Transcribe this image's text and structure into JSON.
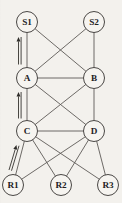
{
  "diagram": {
    "background_color": "#f3f1ed",
    "node_fill_color": "#f6f4f0",
    "node_stroke_color": "#4a4745",
    "edge_color": "#5d5a57",
    "arrow_color": "#2e2c29",
    "node_radius": 10.5,
    "nodes": [
      {
        "id": "S1",
        "label": "S1",
        "x": 27,
        "y": 22,
        "layer": "top"
      },
      {
        "id": "S2",
        "label": "S2",
        "x": 94,
        "y": 22,
        "layer": "top"
      },
      {
        "id": "A",
        "label": "A",
        "x": 27,
        "y": 78,
        "layer": "upper-middle"
      },
      {
        "id": "B",
        "label": "B",
        "x": 94,
        "y": 78,
        "layer": "upper-middle"
      },
      {
        "id": "C",
        "label": "C",
        "x": 27,
        "y": 131,
        "layer": "lower-middle"
      },
      {
        "id": "D",
        "label": "D",
        "x": 94,
        "y": 131,
        "layer": "lower-middle"
      },
      {
        "id": "R1",
        "label": "R1",
        "x": 13,
        "y": 185,
        "layer": "bottom"
      },
      {
        "id": "R2",
        "label": "R2",
        "x": 61,
        "y": 185,
        "layer": "bottom"
      },
      {
        "id": "R3",
        "label": "R3",
        "x": 108,
        "y": 185,
        "layer": "bottom"
      }
    ],
    "edges": [
      {
        "from": "S1",
        "to": "A",
        "kind": "arrow-double",
        "direction": "up"
      },
      {
        "from": "S1",
        "to": "B",
        "kind": "plain"
      },
      {
        "from": "S2",
        "to": "A",
        "kind": "plain"
      },
      {
        "from": "S2",
        "to": "B",
        "kind": "plain"
      },
      {
        "from": "A",
        "to": "B",
        "kind": "plain"
      },
      {
        "from": "A",
        "to": "C",
        "kind": "arrow-double",
        "direction": "up"
      },
      {
        "from": "A",
        "to": "D",
        "kind": "plain"
      },
      {
        "from": "B",
        "to": "C",
        "kind": "plain"
      },
      {
        "from": "B",
        "to": "D",
        "kind": "plain"
      },
      {
        "from": "C",
        "to": "D",
        "kind": "plain"
      },
      {
        "from": "R1",
        "to": "C",
        "kind": "arrow-double",
        "direction": "up"
      },
      {
        "from": "R1",
        "to": "D",
        "kind": "plain"
      },
      {
        "from": "R2",
        "to": "C",
        "kind": "plain"
      },
      {
        "from": "R2",
        "to": "D",
        "kind": "plain"
      },
      {
        "from": "R3",
        "to": "C",
        "kind": "plain"
      },
      {
        "from": "R3",
        "to": "D",
        "kind": "plain"
      }
    ],
    "arrow_annotations": [
      {
        "id": "arrow-s1-a",
        "x1": 18.5,
        "y1": 64.5,
        "x2": 18.5,
        "y2": 37.0,
        "offset": 2.6
      },
      {
        "id": "arrow-a-c",
        "x1": 18.5,
        "y1": 118.5,
        "x2": 18.5,
        "y2": 92.0,
        "offset": 2.6
      },
      {
        "id": "arrow-r1-c",
        "x1": 9.0,
        "y1": 170.0,
        "x2": 16.5,
        "y2": 145.0,
        "offset": 2.6
      }
    ]
  }
}
